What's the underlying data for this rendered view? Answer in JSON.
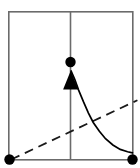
{
  "figure": {
    "title": "Impulse response diagram",
    "width": 140,
    "height": 168,
    "background_color": "#ffffff"
  },
  "colors": {
    "frame": "#6b6b6b",
    "axis": "#6b6b6b",
    "curve": "#000000",
    "dashed": "#1a1a1a",
    "marker": "#000000",
    "arrow": "#000000"
  },
  "frame": {
    "label": "plot-border",
    "x": 8,
    "y": 11,
    "width": 125,
    "height": 149,
    "stroke_width": 1.6
  },
  "vertical_axis": {
    "label": "vertical-divider",
    "x": 70.5,
    "y_top": 11,
    "y_bottom": 160,
    "stroke_width": 1.6
  },
  "markers": [
    {
      "name": "origin-marker",
      "role": "bottom-left endpoint",
      "x": 9.5,
      "y": 159.5,
      "radius": 5.2,
      "fill": "#000000"
    },
    {
      "name": "peak-marker",
      "role": "impulse top point",
      "x": 70.5,
      "y": 62,
      "radius": 5.2,
      "fill": "#000000"
    },
    {
      "name": "terminal-marker",
      "role": "bottom-right endpoint",
      "x": 132.5,
      "y": 159.5,
      "radius": 5.2,
      "fill": "#000000"
    }
  ],
  "arrow": {
    "name": "upward-impulse-arrow",
    "direction": "up",
    "tip_x": 70.5,
    "tip_y": 71,
    "base_y": 89,
    "half_width": 7.5,
    "fill": "#000000"
  },
  "chart_data": {
    "type": "line",
    "title": "Impulse response diagram",
    "xlabel": "",
    "ylabel": "",
    "xlim": [
      0,
      1
    ],
    "ylim": [
      0,
      1
    ],
    "grid": false,
    "legend": "none",
    "series": [
      {
        "name": "exponential-decay-curve",
        "style": "solid",
        "color": "#000000",
        "description": "Decaying curve from impulse arrow tip asymptoting to terminal marker",
        "x": [
          0.5,
          0.53,
          0.56,
          0.6,
          0.64,
          0.68,
          0.73,
          0.78,
          0.84,
          0.9,
          0.96,
          1.0
        ],
        "y": [
          0.597,
          0.54,
          0.47,
          0.39,
          0.315,
          0.25,
          0.19,
          0.14,
          0.098,
          0.068,
          0.052,
          0.045
        ]
      },
      {
        "name": "linear-dashed-reference",
        "style": "dashed",
        "color": "#1a1a1a",
        "description": "Straight dashed line rising from origin marker past the right border",
        "x": [
          0.012,
          1.04
        ],
        "y": [
          0.0,
          0.4
        ]
      }
    ],
    "annotations": [
      {
        "name": "impulse-arrow",
        "type": "arrow",
        "x": 0.5,
        "y_from": 0.475,
        "y_to": 0.597
      },
      {
        "name": "vertical-divider",
        "type": "vline",
        "x": 0.5
      },
      {
        "name": "origin-marker",
        "type": "point",
        "x": 0.012,
        "y": 0.0
      },
      {
        "name": "peak-marker",
        "type": "point",
        "x": 0.5,
        "y": 0.655
      },
      {
        "name": "terminal-marker",
        "type": "point",
        "x": 1.0,
        "y": 0.0
      }
    ]
  }
}
